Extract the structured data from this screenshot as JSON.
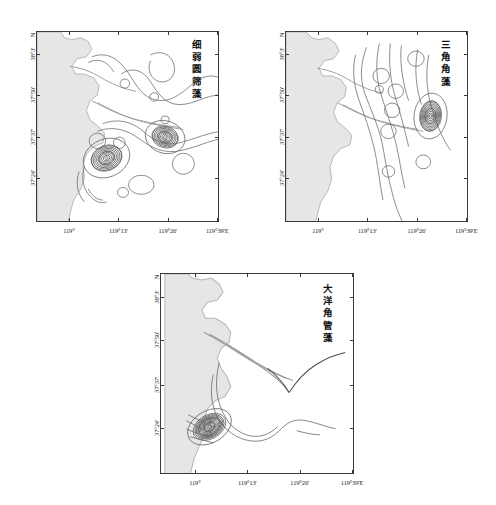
{
  "figure": {
    "type": "contour-map-panels",
    "background": "#ffffff",
    "panel_count": 3
  },
  "axes": {
    "x_ticks": [
      "119°",
      "119°13'",
      "119°26'",
      "119°39'E"
    ],
    "x_tick_positions_pct": [
      18,
      45,
      72,
      99
    ],
    "y_ticks": [
      "38°3'",
      "37°50'",
      "37°37'",
      "37°24'"
    ],
    "y_tick_positions_pct": [
      12,
      33.5,
      55.5,
      77
    ],
    "north_label": "N",
    "tick_color": "#3a3a3a",
    "frame_color": "#3a3a3a"
  },
  "panels": [
    {
      "id": "panel-1",
      "title": "细弱圆筛藻",
      "title_chars": [
        "细",
        "弱",
        "圆",
        "筛",
        "藻"
      ],
      "species_latin": "Coscinodiscus subtilis",
      "position": {
        "left": 36,
        "top": 31,
        "width": 183,
        "height": 191
      },
      "contour_maxima": 2,
      "contour_labels": [
        "0.2",
        "0.2",
        "0.4",
        "0.6",
        "0.8",
        "0.2",
        "0.4"
      ]
    },
    {
      "id": "panel-2",
      "title": "三角角藻",
      "title_chars": [
        "三",
        "角",
        "角",
        "藻"
      ],
      "species_latin": "Ceratium tripos",
      "position": {
        "left": 285,
        "top": 31,
        "width": 183,
        "height": 191
      },
      "contour_maxima": 1,
      "contour_labels": [
        "0.2",
        "0.4",
        "0.6",
        "0.8"
      ]
    },
    {
      "id": "panel-3",
      "title": "大洋角管藻",
      "title_chars": [
        "大",
        "洋",
        "角",
        "管",
        "藻"
      ],
      "species_latin": "Cerataulina pelagica",
      "position": {
        "left": 160,
        "top": 273,
        "width": 194,
        "height": 201
      },
      "contour_maxima": 1,
      "contour_labels": [
        "0.2",
        "0.4"
      ]
    }
  ],
  "colors": {
    "land_fill": "#e6e6e6",
    "land_stroke": "#b4b4b4",
    "contour_stroke": "#6e6e6e",
    "text": "#1a1a1a"
  }
}
